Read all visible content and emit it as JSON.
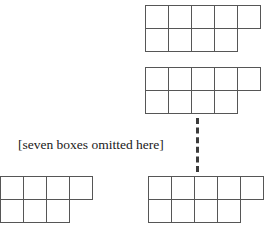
{
  "figure": {
    "background_color": "#ffffff",
    "line_color": "#565656",
    "text_color": "#1a1a1a",
    "cell_size_px": 24,
    "caption": {
      "text": "[seven boxes omitted here]",
      "x": 18,
      "y": 138,
      "font_size_px": 13.5
    },
    "connector": {
      "name": "vertical-dashed-line",
      "color": "#3a3a3a",
      "x": 196,
      "y": 118,
      "height": 54,
      "thickness_px": 3,
      "style": "dashed"
    },
    "shapes": [
      {
        "id": "shape-1",
        "label": "top-row-5-bottom-row-4",
        "x": 145,
        "y": 5,
        "rows": [
          5,
          4
        ],
        "clipped_left": false
      },
      {
        "id": "shape-2",
        "label": "top-row-5-bottom-row-4",
        "x": 145,
        "y": 67,
        "rows": [
          5,
          4
        ],
        "clipped_left": false
      },
      {
        "id": "shape-3",
        "label": "top-row-5-bottom-row-4-clipped",
        "x": -23,
        "y": 176,
        "rows": [
          5,
          4
        ],
        "clipped_left": true
      },
      {
        "id": "shape-4",
        "label": "top-row-5-bottom-row-4",
        "x": 148,
        "y": 176,
        "rows": [
          5,
          4
        ],
        "clipped_left": false
      }
    ]
  }
}
